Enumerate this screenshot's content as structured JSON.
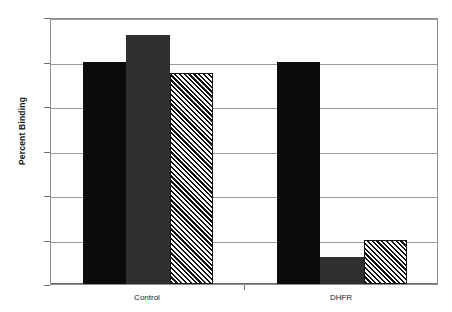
{
  "chart_data": {
    "type": "bar",
    "title": "",
    "subtitle": "",
    "xlabel": "",
    "ylabel": "Percent Binding",
    "categories": [
      "Control",
      "DHFR"
    ],
    "ylim": [
      0,
      120
    ],
    "yticks": [
      0,
      20,
      40,
      60,
      80,
      100,
      120
    ],
    "ytick_labels": [
      "0",
      "20",
      "40",
      "60",
      "80",
      "100",
      "120"
    ],
    "grid": "horizontal",
    "legend": "none",
    "series": [
      {
        "name": "series-1",
        "fill": "solid-black",
        "values": [
          100,
          100
        ]
      },
      {
        "name": "series-2",
        "fill": "solid-gray",
        "values": [
          112,
          12
        ]
      },
      {
        "name": "series-3",
        "fill": "diagonal-hatch",
        "values": [
          95,
          20
        ]
      }
    ],
    "colors": {
      "series_1": "#0b0b0b",
      "series_2": "#2f2f2f",
      "series_3_hatch": "#111111",
      "series_3_background": "#ffffff",
      "gridline": "#9a9a9a",
      "frame": "#8d8d8d",
      "text": "#1b1b1b",
      "plot_background": "#ffffff"
    }
  }
}
